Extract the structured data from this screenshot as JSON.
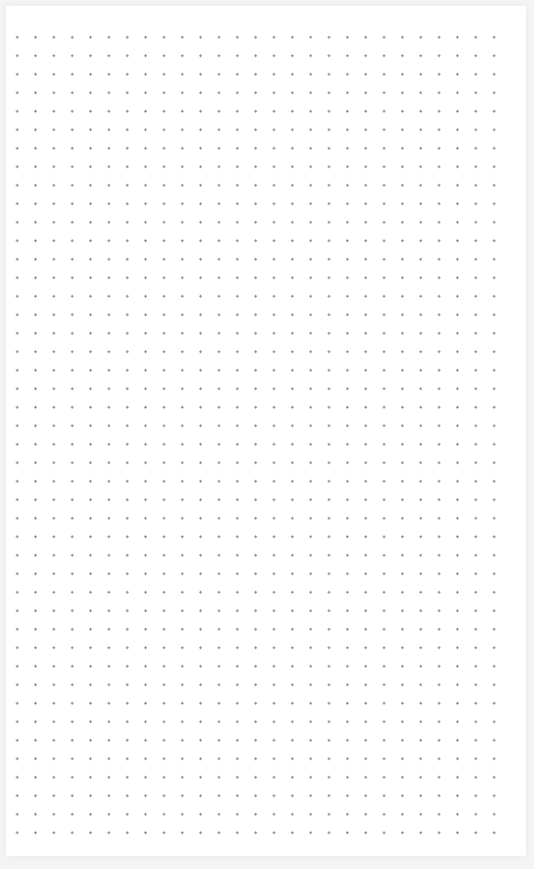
{
  "sheet": {
    "pattern": "dot-grid",
    "columns": 27,
    "rows": 44,
    "dot_color": "#8c8c8c",
    "background_color": "#ffffff",
    "frame_color": "#f4f4f4"
  }
}
